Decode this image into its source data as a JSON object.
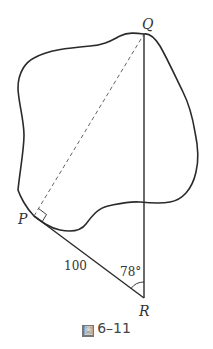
{
  "diagram": {
    "points": {
      "Q": {
        "label": "Q",
        "x": 144,
        "y": 34
      },
      "P": {
        "label": "P",
        "x": 34,
        "y": 216
      },
      "R": {
        "label": "R",
        "x": 144,
        "y": 298
      }
    },
    "segments": [
      {
        "from": "P",
        "to": "Q",
        "style": "dashed"
      },
      {
        "from": "Q",
        "to": "R",
        "style": "solid"
      },
      {
        "from": "P",
        "to": "R",
        "style": "solid"
      }
    ],
    "labels": {
      "side_PR": "100",
      "angle_R": "78°"
    },
    "right_angle_at": "P",
    "region": "irregular closed outline (lake)"
  },
  "caption": {
    "prefix": "圖",
    "number": "6–11"
  },
  "colors": {
    "stroke": "#2a2a2a",
    "dashed": "#666666",
    "text": "#333333"
  }
}
